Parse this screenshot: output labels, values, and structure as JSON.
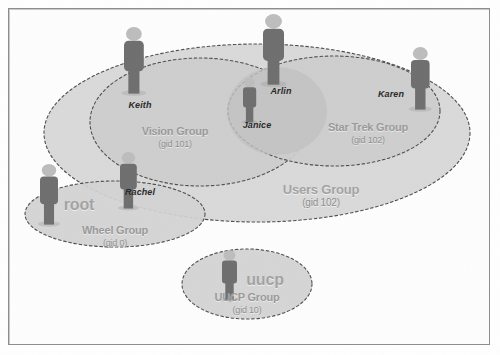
{
  "figure": {
    "background_color": "#fdfdfd",
    "frame_color": "#8d8d8d"
  },
  "palette": {
    "ellipse_fill_outer": "#d6d6d6",
    "ellipse_fill_inner": "#cfcfcf",
    "ellipse_fill_deep": "#c6c6c6",
    "ellipse_stroke": "#4f4f4f",
    "group_label_color": "#9a9a9a",
    "person_label_color": "#2b2b2b",
    "person_body_color": "#6f6f6f",
    "person_head_color": "#bdbdbd"
  },
  "groups": [
    {
      "id": "users-group",
      "name": "Users Group",
      "gid_label": "(gid 102)",
      "gid": 102,
      "name_x": 321,
      "name_y": 183,
      "gid_x": 321,
      "gid_y": 198,
      "name_size": 13,
      "gid_size": 10,
      "style": "account-word",
      "ellipse": {
        "cx": 257,
        "cy": 133,
        "rx": 213,
        "ry": 89
      }
    },
    {
      "id": "vision-group",
      "name": "Vision Group",
      "gid_label": "(gid 101)",
      "gid": 101,
      "name_x": 175,
      "name_y": 126,
      "gid_x": 175,
      "gid_y": 140,
      "name_size": 11,
      "gid_size": 9,
      "style": "group-name",
      "ellipse": {
        "cx": 200,
        "cy": 122,
        "rx": 110,
        "ry": 64
      }
    },
    {
      "id": "star-trek-group",
      "name": "Star Trek Group",
      "gid_label": "(gid 102)",
      "gid": 102,
      "name_x": 368,
      "name_y": 122,
      "gid_x": 368,
      "gid_y": 136,
      "name_size": 11,
      "gid_size": 9,
      "style": "group-name",
      "ellipse": {
        "cx": 334,
        "cy": 111,
        "rx": 106,
        "ry": 55
      }
    },
    {
      "id": "janice-overlap",
      "name": "",
      "gid_label": "",
      "ellipse": {
        "cx": 277,
        "cy": 111,
        "rx": 50,
        "ry": 44
      }
    },
    {
      "id": "wheel-group",
      "name": "Wheel Group",
      "gid_label": "(gid 0)",
      "gid": 0,
      "name_x": 115,
      "name_y": 225,
      "gid_x": 115,
      "gid_y": 239,
      "name_size": 11,
      "gid_size": 9,
      "style": "group-name",
      "ellipse": {
        "cx": 115,
        "cy": 214,
        "rx": 90,
        "ry": 33
      }
    },
    {
      "id": "uucp-group",
      "name": "UUCP Group",
      "gid_label": "(gid 10)",
      "gid": 10,
      "name_x": 247,
      "name_y": 292,
      "gid_x": 247,
      "gid_y": 306,
      "name_size": 11,
      "gid_size": 9,
      "style": "group-name",
      "ellipse": {
        "cx": 247,
        "cy": 284,
        "rx": 65,
        "ry": 35
      }
    }
  ],
  "accounts": [
    {
      "id": "root-account",
      "label": "root",
      "x": 79,
      "y": 196,
      "size": 16
    },
    {
      "id": "uucp-account",
      "label": "uucp",
      "x": 265,
      "y": 271,
      "size": 16
    }
  ],
  "people": [
    {
      "id": "keith",
      "name": "Keith",
      "label_x": 140,
      "label_y": 101,
      "fig_x": 124,
      "fig_y": 27,
      "fig_h": 66
    },
    {
      "id": "arlin",
      "name": "Arlin",
      "label_x": 281,
      "label_y": 87,
      "fig_x": 263,
      "fig_y": 14,
      "fig_h": 70
    },
    {
      "id": "janice",
      "name": "Janice",
      "label_x": 257,
      "label_y": 121,
      "fig_x": 243,
      "fig_y": 78,
      "fig_h": 44
    },
    {
      "id": "karen",
      "name": "Karen",
      "label_x": 391,
      "label_y": 90,
      "fig_x": 411,
      "fig_y": 47,
      "fig_h": 62
    },
    {
      "id": "rachel",
      "name": "Rachel",
      "label_x": 140,
      "label_y": 188,
      "fig_x": 120,
      "fig_y": 152,
      "fig_h": 56
    },
    {
      "id": "root",
      "name": "",
      "label_x": 0,
      "label_y": 0,
      "fig_x": 40,
      "fig_y": 164,
      "fig_h": 60
    },
    {
      "id": "uucp",
      "name": "",
      "label_x": 0,
      "label_y": 0,
      "fig_x": 222,
      "fig_y": 250,
      "fig_h": 50
    }
  ],
  "membership": {
    "users_group": [
      "Keith",
      "Arlin",
      "Janice",
      "Karen",
      "Rachel"
    ],
    "vision_group": [
      "Keith",
      "Janice",
      "Rachel"
    ],
    "star_trek_group": [
      "Arlin",
      "Janice",
      "Karen"
    ],
    "wheel_group": [
      "root",
      "Rachel"
    ],
    "uucp_group": [
      "uucp"
    ]
  }
}
